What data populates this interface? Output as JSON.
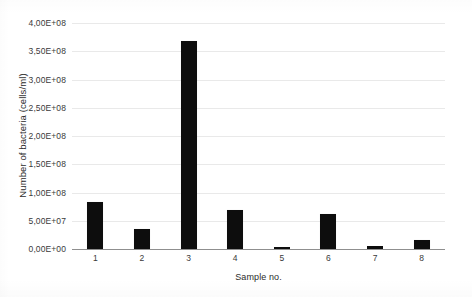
{
  "chart_data": {
    "type": "bar",
    "title": "",
    "xlabel": "Sample no.",
    "ylabel": "Number of bacteria (cells/ml)",
    "categories": [
      "1",
      "2",
      "3",
      "4",
      "5",
      "6",
      "7",
      "8"
    ],
    "values": [
      83000000,
      35000000,
      368000000,
      69000000,
      3000000,
      62000000,
      5000000,
      16000000
    ],
    "ylim": [
      0,
      400000000
    ],
    "ytick_values": [
      0,
      50000000,
      100000000,
      150000000,
      200000000,
      250000000,
      300000000,
      350000000,
      400000000
    ],
    "ytick_labels": [
      "0,00E+00",
      "5,00E+07",
      "1,00E+08",
      "1,50E+08",
      "2,00E+08",
      "2,50E+08",
      "3,00E+08",
      "3,50E+08",
      "4,00E+08"
    ],
    "grid": true,
    "legend": null,
    "bar_color": "#0d0d0d",
    "grid_color": "#e9e9e9",
    "axis_color": "#8f8f8f",
    "background_color": "#ffffff"
  }
}
